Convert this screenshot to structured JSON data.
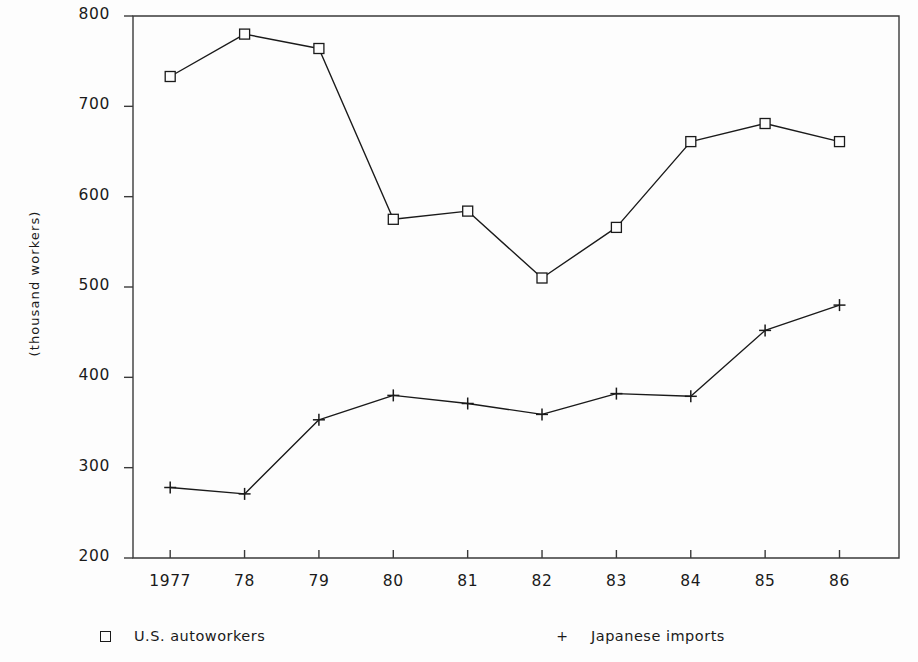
{
  "chart_data": {
    "type": "line",
    "title": "",
    "xlabel": "",
    "ylabel": "(thousand workers)",
    "categories": [
      "1977",
      "78",
      "79",
      "80",
      "81",
      "82",
      "83",
      "84",
      "85",
      "86"
    ],
    "x": [
      1977,
      1978,
      1979,
      1980,
      1981,
      1982,
      1983,
      1984,
      1985,
      1986
    ],
    "xlim": [
      1976.5,
      1986.8
    ],
    "ylim": [
      200,
      800
    ],
    "yticks": [
      200,
      300,
      400,
      500,
      600,
      700,
      800
    ],
    "ytick_labels": [
      "200",
      "300",
      "400",
      "500",
      "600",
      "700",
      "800"
    ],
    "grid": false,
    "legend_position": "below-axes",
    "series": [
      {
        "name": "U.S. autoworkers",
        "marker": "square",
        "color": "#1a1a1a",
        "values": [
          733,
          780,
          764,
          575,
          584,
          510,
          566,
          661,
          681,
          661
        ]
      },
      {
        "name": "Japanese imports",
        "marker": "plus",
        "color": "#1a1a1a",
        "values": [
          278,
          271,
          353,
          380,
          371,
          359,
          382,
          379,
          452,
          480
        ]
      }
    ]
  },
  "axis": {
    "y_label_text": "(thousand workers)"
  },
  "legend": {
    "entries": [
      {
        "marker_glyph": "square",
        "label": "U.S. autoworkers"
      },
      {
        "marker_glyph": "plus",
        "label": "Japanese imports"
      }
    ]
  },
  "colors": {
    "ink": "#1a1a1a",
    "background": "#fdfdfd",
    "axis": "#3a3a3a"
  }
}
